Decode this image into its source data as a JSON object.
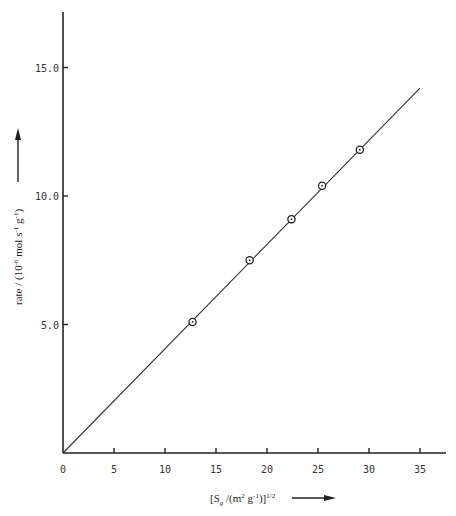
{
  "chart_data": {
    "type": "scatter",
    "title": "",
    "xlabel": "[S_g /(m^2 g^-1)]^1/2",
    "ylabel": "rate / (10^-6 mol s^-1 g^-1)",
    "xlim": [
      0,
      36
    ],
    "ylim": [
      0,
      17
    ],
    "x_ticks": [
      0,
      5,
      10,
      15,
      20,
      25,
      30,
      35
    ],
    "x_tick_labels": [
      "0",
      "5",
      "10",
      "15",
      "20",
      "25",
      "30",
      "35"
    ],
    "y_ticks": [
      5,
      10,
      15
    ],
    "y_tick_labels": [
      "5.0",
      "10.0",
      "15.0"
    ],
    "grid": false,
    "legend": null,
    "series": [
      {
        "name": "measured",
        "marker": "circle-dot",
        "x": [
          12.7,
          18.3,
          22.4,
          25.4,
          29.1
        ],
        "y": [
          5.1,
          7.5,
          9.1,
          10.4,
          11.8
        ]
      },
      {
        "name": "fit line",
        "style": "line",
        "x": [
          0,
          35
        ],
        "y": [
          0,
          14.2
        ]
      }
    ],
    "annotations": [
      "arrow up beside y-axis label",
      "arrow right beside x-axis label"
    ]
  },
  "labels": {
    "x_title_main": "[S",
    "x_title_sub": "g",
    "x_title_rest": " /(m",
    "x_title_sup1": "2",
    "x_title_g": " g",
    "x_title_sup2": "-1",
    "x_title_close": ")]",
    "x_title_sup3": "1/2",
    "y_title_a": "rate / (10",
    "y_title_sup1": "-6",
    "y_title_b": " mol s",
    "y_title_sup2": "-1",
    "y_title_c": " g",
    "y_title_sup3": "-1",
    "y_title_d": ")"
  }
}
